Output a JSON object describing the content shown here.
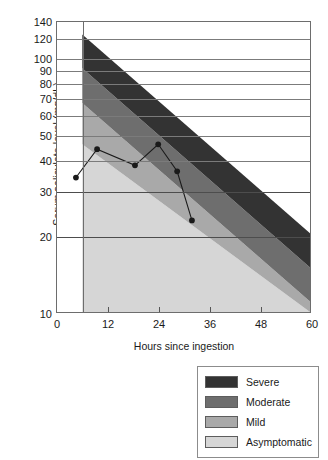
{
  "chart_data": {
    "type": "area",
    "title": "",
    "subtitle": "",
    "xlabel": "Hours since ingestion",
    "ylabel": "Serum salicylate level (mg/dL)",
    "xlim": [
      0,
      60
    ],
    "ylim": [
      10,
      140
    ],
    "yscale": "log",
    "grid": "horizontal",
    "legend_position": "below-right",
    "xticks": [
      {
        "value": 0,
        "label": "0"
      },
      {
        "value": 12,
        "label": "12"
      },
      {
        "value": 24,
        "label": "24"
      },
      {
        "value": 36,
        "label": "36"
      },
      {
        "value": 48,
        "label": "48"
      },
      {
        "value": 60,
        "label": "60"
      }
    ],
    "yticks": [
      {
        "value": 140,
        "label": "140"
      },
      {
        "value": 120,
        "label": "120"
      },
      {
        "value": 100,
        "label": "100"
      },
      {
        "value": 90,
        "label": "90"
      },
      {
        "value": 80,
        "label": "80"
      },
      {
        "value": 70,
        "label": "70"
      },
      {
        "value": 60,
        "label": "60"
      },
      {
        "value": 50,
        "label": "50"
      },
      {
        "value": 40,
        "label": "40"
      },
      {
        "value": 30,
        "label": "30"
      },
      {
        "value": 20,
        "label": "20"
      },
      {
        "value": 10,
        "label": "10"
      }
    ],
    "zone_start_hour": 6,
    "zones": [
      {
        "name": "Severe",
        "color": "#333333",
        "upper_at_6h": 125,
        "lower_at_6h": 92,
        "upper_at_60h": 20.5,
        "lower_at_60h": 15.0
      },
      {
        "name": "Moderate",
        "color": "#6e6e6e",
        "upper_at_6h": 92,
        "lower_at_6h": 67,
        "upper_at_60h": 15.0,
        "lower_at_60h": 11.0
      },
      {
        "name": "Mild",
        "color": "#a9a9a9",
        "upper_at_6h": 67,
        "lower_at_6h": 46,
        "upper_at_60h": 11.0,
        "lower_at_60h": 10.0
      },
      {
        "name": "Asymptomatic",
        "color": "#d6d6d6",
        "upper_at_6h": 46,
        "lower_at_6h": 10,
        "upper_at_60h": 10.0,
        "lower_at_60h": 10.0
      }
    ],
    "series": [
      {
        "name": "Measured serum salicylate",
        "marker": "filled-circle",
        "line_color": "#1a1a1a",
        "points": [
          {
            "x": 4.5,
            "y": 34
          },
          {
            "x": 9.5,
            "y": 44
          },
          {
            "x": 18.5,
            "y": 38
          },
          {
            "x": 24.0,
            "y": 46
          },
          {
            "x": 28.5,
            "y": 36
          },
          {
            "x": 32.0,
            "y": 23
          }
        ]
      }
    ]
  },
  "legend": {
    "items": [
      {
        "label": "Severe",
        "color": "#333333"
      },
      {
        "label": "Moderate",
        "color": "#6e6e6e"
      },
      {
        "label": "Mild",
        "color": "#a9a9a9"
      },
      {
        "label": "Asymptomatic",
        "color": "#d6d6d6"
      }
    ]
  }
}
